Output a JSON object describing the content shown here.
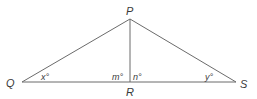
{
  "diagram": {
    "type": "triangle",
    "stroke_color": "#6b6b6b",
    "label_color": "#3a3a3a",
    "vertices": {
      "P": {
        "label": "P",
        "x": 130,
        "y": 19
      },
      "Q": {
        "label": "Q",
        "x": 22,
        "y": 82
      },
      "R": {
        "label": "R",
        "x": 130,
        "y": 82
      },
      "S": {
        "label": "S",
        "x": 236,
        "y": 82
      }
    },
    "segments": [
      "PQ",
      "PS",
      "QS",
      "PR"
    ],
    "angles": {
      "x": {
        "label": "x°",
        "at": "Q"
      },
      "m": {
        "label": "m°",
        "at": "R",
        "side": "left"
      },
      "n": {
        "label": "n°",
        "at": "R",
        "side": "right"
      },
      "y": {
        "label": "y°",
        "at": "S"
      }
    }
  }
}
